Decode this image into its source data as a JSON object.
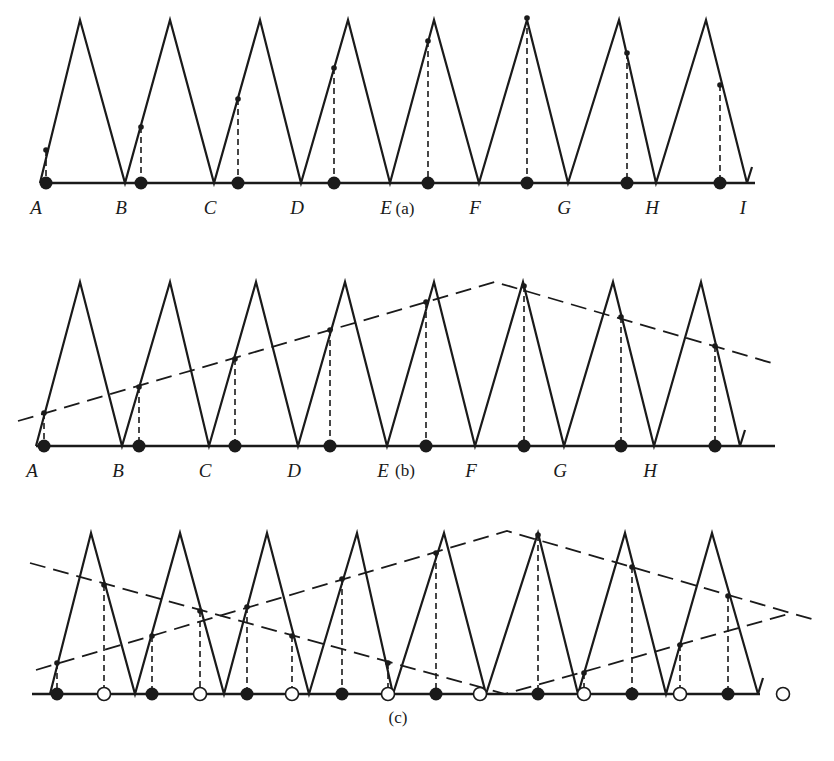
{
  "figure": {
    "panels": [
      {
        "id": "a",
        "caption": "(a)",
        "baseline_y": 183,
        "peak_y": 20,
        "x_start": 40,
        "x_end": 755,
        "valleys_x": [
          40,
          125,
          214,
          301,
          390,
          479,
          568,
          656,
          747
        ],
        "peaks_x": [
          80,
          170,
          260,
          348,
          434,
          527,
          619,
          706
        ],
        "valley_labels": [
          "A",
          "B",
          "C",
          "D",
          "E",
          "F",
          "G",
          "H",
          "I"
        ],
        "samples": [
          {
            "x": 46,
            "y": 150
          },
          {
            "x": 141,
            "y": 127
          },
          {
            "x": 238,
            "y": 99
          },
          {
            "x": 334,
            "y": 68
          },
          {
            "x": 428,
            "y": 41
          },
          {
            "x": 527,
            "y": 18
          },
          {
            "x": 627,
            "y": 53
          },
          {
            "x": 720,
            "y": 85
          }
        ],
        "envelopes": []
      },
      {
        "id": "b",
        "caption": "(b)",
        "baseline_y": 446,
        "peak_y": 282,
        "x_start": 36,
        "x_end": 775,
        "valleys_x": [
          36,
          122,
          209,
          298,
          387,
          475,
          564,
          654,
          740
        ],
        "peaks_x": [
          80,
          170,
          256,
          345,
          434,
          523,
          613,
          701
        ],
        "valley_labels": [
          "A",
          "B",
          "C",
          "D",
          "E",
          "F",
          "G",
          "H"
        ],
        "samples": [
          {
            "x": 44,
            "y": 413
          },
          {
            "x": 139,
            "y": 387
          },
          {
            "x": 235,
            "y": 359
          },
          {
            "x": 330,
            "y": 330
          },
          {
            "x": 426,
            "y": 302
          },
          {
            "x": 524,
            "y": 286
          },
          {
            "x": 621,
            "y": 317
          },
          {
            "x": 715,
            "y": 346
          }
        ],
        "envelopes": [
          [
            [
              18,
              421
            ],
            [
              495,
              282
            ],
            [
              775,
              364
            ]
          ]
        ]
      },
      {
        "id": "c",
        "caption": "(c)",
        "baseline_y": 694,
        "peak_y": 533,
        "x_start": 32,
        "x_end": 760,
        "valleys_x": [
          50,
          135,
          224,
          309,
          393,
          486,
          578,
          666,
          758
        ],
        "peaks_x": [
          91,
          180,
          267,
          357,
          444,
          538,
          625,
          712
        ],
        "valley_labels": [],
        "samples_filled": [
          {
            "x": 57,
            "y": 663
          },
          {
            "x": 152,
            "y": 636
          },
          {
            "x": 247,
            "y": 607
          },
          {
            "x": 342,
            "y": 579
          },
          {
            "x": 436,
            "y": 553
          },
          {
            "x": 538,
            "y": 535
          },
          {
            "x": 632,
            "y": 567
          },
          {
            "x": 728,
            "y": 596
          }
        ],
        "samples_open": [
          {
            "x": 104,
            "y": 585
          },
          {
            "x": 200,
            "y": 611
          },
          {
            "x": 292,
            "y": 636
          },
          {
            "x": 388,
            "y": 663
          },
          {
            "x": 480,
            "y": 694
          },
          {
            "x": 584,
            "y": 673
          },
          {
            "x": 680,
            "y": 645
          },
          {
            "x": 783,
            "y": 0
          }
        ],
        "envelopes": [
          [
            [
              30,
              563
            ],
            [
              505,
              694
            ],
            [
              788,
              614
            ]
          ],
          [
            [
              36,
              670
            ],
            [
              507,
              531
            ],
            [
              815,
              620
            ]
          ]
        ]
      }
    ]
  }
}
